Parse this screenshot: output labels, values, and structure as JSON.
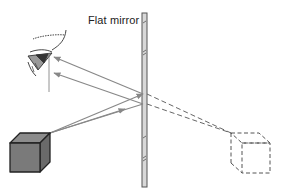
{
  "figure": {
    "mirror_label": "Flat mirror",
    "elements": [
      "flat-mirror",
      "real-object-cube",
      "virtual-image-cube",
      "observer-eye",
      "incident-rays",
      "reflected-rays",
      "virtual-ray-extensions"
    ]
  },
  "colors": {
    "ray": "#888888",
    "mirror_fill": "#d8d8d8",
    "mirror_stroke": "#555555",
    "cube_front": "#7a7a7a",
    "cube_top": "#8c8c8c",
    "cube_side": "#6a6a6a",
    "cube_edge": "#222222",
    "dashed": "#666666"
  }
}
